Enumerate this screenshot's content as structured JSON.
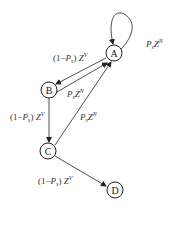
{
  "diagram": {
    "nodes": [
      {
        "id": "A",
        "label": "A"
      },
      {
        "id": "B",
        "label": "B"
      },
      {
        "id": "C",
        "label": "C"
      },
      {
        "id": "D",
        "label": "D"
      }
    ],
    "edges": [
      {
        "from": "A",
        "to": "A",
        "label": "P_s Z^N",
        "parts": {
          "pre": "",
          "P": "P",
          "sub": "s",
          "Z": "Z",
          "sup": "N"
        }
      },
      {
        "from": "A",
        "to": "B",
        "label": "(1−P_s) Z^V",
        "parts": {
          "pre": "(1−",
          "P": "P",
          "sub": "s",
          "post": ") ",
          "Z": "Z",
          "sup": "V"
        }
      },
      {
        "from": "B",
        "to": "A",
        "label": "P_s Z^N",
        "parts": {
          "pre": "",
          "P": "P",
          "sub": "s",
          "Z": "Z",
          "sup": "N"
        }
      },
      {
        "from": "B",
        "to": "C",
        "label": "(1−P_s) Z^V",
        "parts": {
          "pre": "(1−",
          "P": "P",
          "sub": "s",
          "post": ") ",
          "Z": "Z",
          "sup": "V"
        }
      },
      {
        "from": "C",
        "to": "A",
        "label": "P_s Z^N",
        "parts": {
          "pre": "",
          "P": "P",
          "sub": "s",
          "Z": "Z",
          "sup": "N"
        }
      },
      {
        "from": "C",
        "to": "D",
        "label": "(1−P_s) Z^V",
        "parts": {
          "pre": "(1−",
          "P": "P",
          "sub": "s",
          "post": ") ",
          "Z": "Z",
          "sup": "V"
        }
      }
    ]
  }
}
